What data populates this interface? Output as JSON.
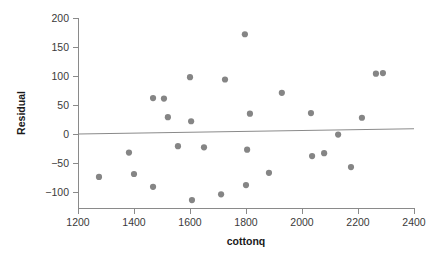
{
  "chart_data": {
    "type": "scatter",
    "title": "",
    "subtitle": "",
    "xlabel": "cottonq",
    "ylabel": "Residual",
    "xlim": [
      1200,
      2400
    ],
    "ylim": [
      -120,
      200
    ],
    "xticks": [
      1200,
      1400,
      1600,
      1800,
      2000,
      2200,
      2400
    ],
    "yticks": [
      -100,
      -50,
      0,
      50,
      100,
      150,
      200
    ],
    "grid": false,
    "legend": null,
    "point_color": "#858585",
    "line_color": "#8a8a8a",
    "axis_color": "#8a8a8a",
    "text_color": "#1a1a1a",
    "background": "#ffffff",
    "series": [
      {
        "name": "residuals",
        "marker": "filled-circle",
        "points": [
          [
            1275,
            -74
          ],
          [
            1382,
            -32
          ],
          [
            1400,
            -69
          ],
          [
            1468,
            62
          ],
          [
            1468,
            -91
          ],
          [
            1507,
            61
          ],
          [
            1521,
            29
          ],
          [
            1557,
            -21
          ],
          [
            1600,
            98
          ],
          [
            1604,
            22
          ],
          [
            1607,
            -114
          ],
          [
            1650,
            -23
          ],
          [
            1711,
            -104
          ],
          [
            1725,
            94
          ],
          [
            1796,
            172
          ],
          [
            1800,
            -88
          ],
          [
            1804,
            -27
          ],
          [
            1814,
            35
          ],
          [
            1882,
            -67
          ],
          [
            1928,
            71
          ],
          [
            2032,
            36
          ],
          [
            2036,
            -38
          ],
          [
            2079,
            -33
          ],
          [
            2129,
            -1
          ],
          [
            2175,
            -57
          ],
          [
            2214,
            28
          ],
          [
            2264,
            104
          ],
          [
            2289,
            105
          ]
        ]
      }
    ],
    "reference_line": {
      "name": "zero-trend-line",
      "x_start": 1200,
      "y_start": 0,
      "x_end": 2400,
      "y_end": 9
    }
  },
  "axes": {
    "y": {
      "title": "Residual",
      "tick_labels": [
        "200",
        "150",
        "100",
        "50",
        "0",
        "-50",
        "-100"
      ]
    },
    "x": {
      "title": "cottonq",
      "tick_labels": [
        "1200",
        "1400",
        "1600",
        "1800",
        "2000",
        "2200",
        "2400"
      ]
    }
  }
}
